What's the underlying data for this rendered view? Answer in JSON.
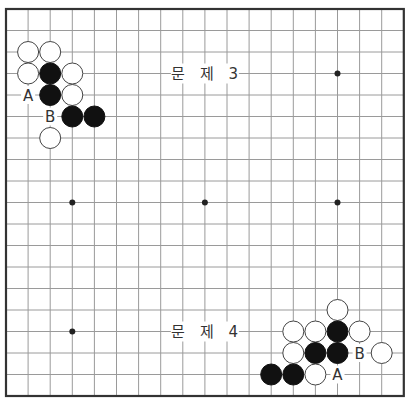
{
  "board": {
    "size": 19,
    "origin_x": 6,
    "origin_y": 9,
    "step_x": 22.1,
    "step_y": 21.5,
    "star_points": [
      [
        4,
        4
      ],
      [
        10,
        4
      ],
      [
        16,
        4
      ],
      [
        4,
        10
      ],
      [
        10,
        10
      ],
      [
        16,
        10
      ],
      [
        4,
        16
      ],
      [
        10,
        16
      ],
      [
        16,
        16
      ]
    ],
    "colors": {
      "frame": "#333333",
      "grid": "#9a9a9a",
      "black": "#111111",
      "white": "#ffffff"
    }
  },
  "problems": [
    {
      "title": "문 제 3",
      "title_pos": [
        10,
        4
      ],
      "stones": [
        {
          "color": "white",
          "col": 2,
          "row": 3
        },
        {
          "color": "white",
          "col": 3,
          "row": 3
        },
        {
          "color": "white",
          "col": 2,
          "row": 4
        },
        {
          "color": "black",
          "col": 3,
          "row": 4
        },
        {
          "color": "white",
          "col": 4,
          "row": 4
        },
        {
          "color": "black",
          "col": 3,
          "row": 5
        },
        {
          "color": "white",
          "col": 4,
          "row": 5
        },
        {
          "color": "black",
          "col": 4,
          "row": 6
        },
        {
          "color": "black",
          "col": 5,
          "row": 6
        },
        {
          "color": "white",
          "col": 3,
          "row": 7
        }
      ],
      "labels": [
        {
          "text": "A",
          "col": 2,
          "row": 5
        },
        {
          "text": "B",
          "col": 3,
          "row": 6
        }
      ]
    },
    {
      "title": "문 제 4",
      "title_pos": [
        10,
        16
      ],
      "stones": [
        {
          "color": "white",
          "col": 16,
          "row": 15
        },
        {
          "color": "white",
          "col": 14,
          "row": 16
        },
        {
          "color": "white",
          "col": 15,
          "row": 16
        },
        {
          "color": "black",
          "col": 16,
          "row": 16
        },
        {
          "color": "white",
          "col": 17,
          "row": 16
        },
        {
          "color": "white",
          "col": 14,
          "row": 17
        },
        {
          "color": "black",
          "col": 15,
          "row": 17
        },
        {
          "color": "black",
          "col": 16,
          "row": 17
        },
        {
          "color": "white",
          "col": 18,
          "row": 17
        },
        {
          "color": "black",
          "col": 13,
          "row": 18
        },
        {
          "color": "black",
          "col": 14,
          "row": 18
        },
        {
          "color": "white",
          "col": 15,
          "row": 18
        }
      ],
      "labels": [
        {
          "text": "B",
          "col": 17,
          "row": 17
        },
        {
          "text": "A",
          "col": 16,
          "row": 18
        }
      ]
    }
  ]
}
